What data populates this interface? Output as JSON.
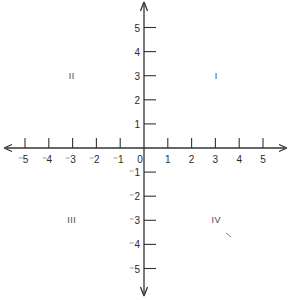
{
  "diagram": {
    "colors": {
      "axis": "#333333",
      "text": "#2a2a2a",
      "background": "#ffffff"
    },
    "x_axis": {
      "ticks": [
        {
          "value": -5,
          "label": "⁻5"
        },
        {
          "value": -4,
          "label": "⁻4"
        },
        {
          "value": -3,
          "label": "⁻3"
        },
        {
          "value": -2,
          "label": "⁻2"
        },
        {
          "value": -1,
          "label": "⁻1"
        },
        {
          "value": 0,
          "label": "0"
        },
        {
          "value": 1,
          "label": "1"
        },
        {
          "value": 2,
          "label": "2"
        },
        {
          "value": 3,
          "label": "3"
        },
        {
          "value": 4,
          "label": "4"
        },
        {
          "value": 5,
          "label": "5"
        }
      ],
      "arrows": [
        "left",
        "right"
      ]
    },
    "y_axis": {
      "ticks": [
        {
          "value": 5,
          "label": "5"
        },
        {
          "value": 4,
          "label": "4"
        },
        {
          "value": 3,
          "label": "3"
        },
        {
          "value": 2,
          "label": "2"
        },
        {
          "value": 1,
          "label": "1"
        },
        {
          "value": -1,
          "label": "⁻1"
        },
        {
          "value": -2,
          "label": "⁻2"
        },
        {
          "value": -3,
          "label": "⁻3"
        },
        {
          "value": -4,
          "label": "⁻4"
        },
        {
          "value": -5,
          "label": "⁻5"
        }
      ],
      "arrows": [
        "up",
        "down"
      ]
    },
    "quadrants": [
      {
        "id": "I",
        "label": "I",
        "x": 3,
        "y": 3
      },
      {
        "id": "II",
        "label": "II",
        "x": -3,
        "y": 3
      },
      {
        "id": "III",
        "label": "III",
        "x": -3,
        "y": -3
      },
      {
        "id": "IV",
        "label": "IV",
        "x": 3,
        "y": -3
      }
    ]
  }
}
